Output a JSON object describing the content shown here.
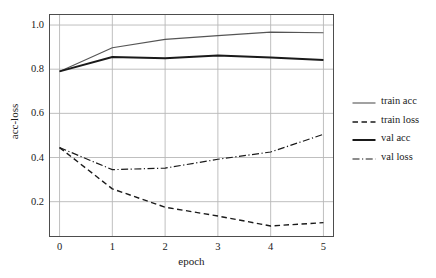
{
  "chart_data": {
    "type": "line",
    "title": "",
    "xlabel": "epoch",
    "ylabel": "acc-loss",
    "x": [
      0,
      1,
      2,
      3,
      4,
      5
    ],
    "xticklabels": [
      "0",
      "1",
      "2",
      "3",
      "4",
      "5"
    ],
    "yticklabels": [
      "1.0",
      "0.8",
      "0.6",
      "0.4",
      "0.2"
    ],
    "yticks": [
      1.0,
      0.8,
      0.6,
      0.4,
      0.2
    ],
    "xlim": [
      -0.2,
      5.2
    ],
    "ylim": [
      0.04,
      1.05
    ],
    "grid": true,
    "legend_position": "right",
    "series": [
      {
        "name": "train acc",
        "values": [
          0.79,
          0.897,
          0.935,
          0.952,
          0.968,
          0.965
        ],
        "color": "#555555",
        "linestyle": "solid",
        "linewidth": 1.1
      },
      {
        "name": "train loss",
        "values": [
          0.445,
          0.258,
          0.175,
          0.135,
          0.09,
          0.105
        ],
        "color": "#1a1a1a",
        "linestyle": "dashed",
        "linewidth": 1.4
      },
      {
        "name": "val acc",
        "values": [
          0.79,
          0.855,
          0.85,
          0.862,
          0.853,
          0.842
        ],
        "color": "#1a1a1a",
        "linestyle": "solid",
        "linewidth": 2.0
      },
      {
        "name": "val loss",
        "values": [
          0.445,
          0.345,
          0.352,
          0.392,
          0.425,
          0.505
        ],
        "color": "#1a1a1a",
        "linestyle": "dashdot",
        "linewidth": 1.2
      }
    ]
  },
  "axes": {
    "xlabel": "epoch",
    "ylabel": "acc-loss",
    "yticks": [
      {
        "label": "1.0",
        "value": 1.0
      },
      {
        "label": "0.8",
        "value": 0.8
      },
      {
        "label": "0.6",
        "value": 0.6
      },
      {
        "label": "0.4",
        "value": 0.4
      },
      {
        "label": "0.2",
        "value": 0.2
      }
    ],
    "xticks": [
      {
        "label": "0",
        "value": 0
      },
      {
        "label": "1",
        "value": 1
      },
      {
        "label": "2",
        "value": 2
      },
      {
        "label": "3",
        "value": 3
      },
      {
        "label": "4",
        "value": 4
      },
      {
        "label": "5",
        "value": 5
      }
    ]
  },
  "legend": {
    "items": [
      {
        "label": "train acc",
        "color": "#555555",
        "linestyle": "solid",
        "linewidth": 1.1
      },
      {
        "label": "train loss",
        "color": "#1a1a1a",
        "linestyle": "dashed",
        "linewidth": 1.4
      },
      {
        "label": "val acc",
        "color": "#1a1a1a",
        "linestyle": "solid",
        "linewidth": 2.0
      },
      {
        "label": "val loss",
        "color": "#1a1a1a",
        "linestyle": "dashdot",
        "linewidth": 1.2
      }
    ]
  },
  "style": {
    "background": "#ffffff",
    "grid_color": "#b8b8b8",
    "spine_color": "#4d4d4d",
    "text_color": "#1a1a1a"
  }
}
